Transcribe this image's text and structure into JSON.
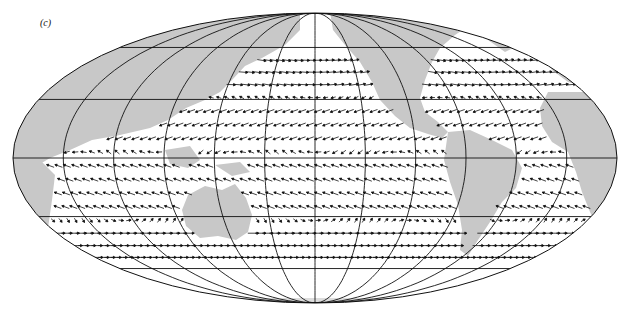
{
  "figure": {
    "label": "(c)",
    "projection": "mollweide",
    "center": [
      315,
      158
    ],
    "rx": 302,
    "ry": 145,
    "colors": {
      "land": "#c8c8c8",
      "ocean": "#ffffff",
      "grid": "#111111",
      "arrow": "#111111",
      "outline": "#111111"
    },
    "parallels_deg": [
      -60,
      -30,
      0,
      30,
      60
    ],
    "meridian_step_deg": 30,
    "vector_rows_deg": [
      52,
      45,
      38,
      31,
      24,
      17,
      10,
      3,
      -4,
      -11,
      -18,
      -25,
      -32,
      -39,
      -46,
      -53
    ]
  },
  "chart_data": {
    "type": "vector_field_map",
    "title": "(c)",
    "graticule": {
      "parallels": [
        "60N",
        "30N",
        "Equator",
        "30S",
        "60S"
      ],
      "meridian_spacing": "30°"
    },
    "landmasses": [
      "Asia",
      "Australia",
      "North America",
      "South America",
      "Africa",
      "Europe",
      "Antarctica (faint)"
    ],
    "dominant_patterns": [
      {
        "band": "40N-55N",
        "direction": "westerlies (eastward)"
      },
      {
        "band": "5N-25N",
        "direction": "NE trades (westward)"
      },
      {
        "band": "5S-25S",
        "direction": "SE trades (westward)"
      },
      {
        "band": "40S-55S",
        "direction": "strong westerlies (eastward)"
      }
    ]
  }
}
